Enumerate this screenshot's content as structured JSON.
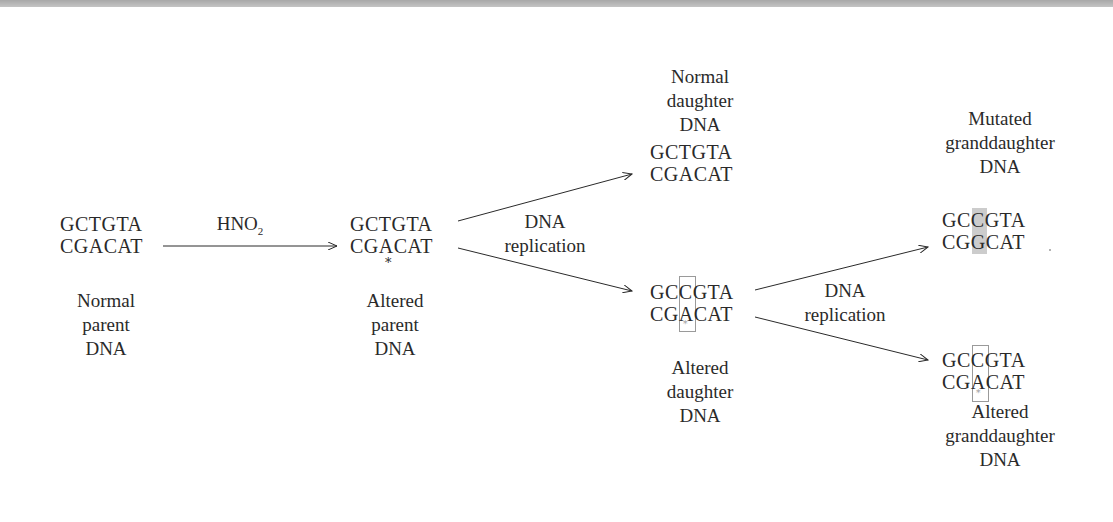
{
  "diagram": {
    "title_bar": "",
    "nodes": {
      "normal_parent": {
        "top_strand": "GCTGTA",
        "bottom_strand": "CGACAT",
        "label": [
          "Normal",
          "parent",
          "DNA"
        ]
      },
      "altered_parent": {
        "top_strand": "GCTGTA",
        "bottom_strand": "CGACAT",
        "marker": "*",
        "label": [
          "Altered",
          "parent",
          "DNA"
        ]
      },
      "normal_daughter": {
        "top_strand": "GCTGTA",
        "bottom_strand": "CGACAT",
        "label": [
          "Normal",
          "daughter",
          "DNA"
        ]
      },
      "altered_daughter": {
        "top_strand": {
          "pre": "GC",
          "hl": "C",
          "post": "GTA"
        },
        "bottom_strand": {
          "pre": "CG",
          "hl": "A",
          "post": "CAT"
        },
        "marker": "*",
        "label": [
          "Altered",
          "daughter",
          "DNA"
        ]
      },
      "mutated_granddaughter": {
        "top_strand": {
          "pre": "GC",
          "hl": "C",
          "post": "GTA"
        },
        "bottom_strand": {
          "pre": "CG",
          "hl": "G",
          "post": "CAT"
        },
        "label": [
          "Mutated",
          "granddaughter",
          "DNA"
        ]
      },
      "altered_granddaughter": {
        "top_strand": {
          "pre": "GC",
          "hl": "C",
          "post": "GTA"
        },
        "bottom_strand": {
          "pre": "CG",
          "hl": "A",
          "post": "CAT"
        },
        "marker": "*",
        "label": [
          "Altered",
          "granddaughter",
          "DNA"
        ]
      }
    },
    "edges": {
      "treatment": {
        "label_main": "HNO",
        "label_sub": "2"
      },
      "replication_1": {
        "label": [
          "DNA",
          "replication"
        ]
      },
      "replication_2": {
        "label": [
          "DNA",
          "replication"
        ]
      }
    },
    "colors": {
      "text": "#2a2a2a",
      "highlight_box": "#9a9a9a",
      "mutation_shade": "#cccccc"
    }
  }
}
